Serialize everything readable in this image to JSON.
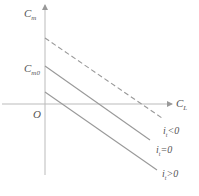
{
  "diagram": {
    "y_axis_label": "C",
    "y_axis_sub": "m",
    "x_axis_label": "C",
    "x_axis_sub": "L",
    "origin_label": "O",
    "intercept_label": "C",
    "intercept_sub": "m0",
    "lines": [
      {
        "name": "i_t<0",
        "label": "i",
        "sub": "t",
        "rel": "<0",
        "style": "dashed"
      },
      {
        "name": "i_t=0",
        "label": "i",
        "sub": "t",
        "rel": "=0",
        "style": "solid"
      },
      {
        "name": "i_t>0",
        "label": "i",
        "sub": "t",
        "rel": ">0",
        "style": "solid"
      }
    ],
    "colors": {
      "axis": "#aaaaaa",
      "line": "#999999",
      "text": "#555555"
    }
  }
}
